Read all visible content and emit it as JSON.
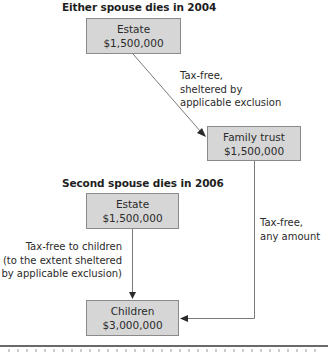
{
  "sections": [
    {
      "heading": "Either spouse dies in 2004",
      "estate": {
        "title": "Estate",
        "amount": "$1,500,000"
      },
      "transfer_label": [
        "Tax-free,",
        "sheltered by",
        "applicable exclusion"
      ],
      "trust": {
        "title": "Family trust",
        "amount": "$1,500,000"
      }
    },
    {
      "heading": "Second spouse dies in 2006",
      "estate": {
        "title": "Estate",
        "amount": "$1,500,000"
      },
      "transfer_label": [
        "Tax-free to children",
        "(to the extent sheltered",
        "by applicable exclusion)"
      ],
      "trust_to_children_label": [
        "Tax-free,",
        "any amount"
      ],
      "children": {
        "title": "Children",
        "amount": "$3,000,000"
      }
    }
  ],
  "colors": {
    "box_fill": "#d6d6d6",
    "box_border": "#8a8a8a",
    "line": "#7a7a7a",
    "arrowhead": "#2a2a2a"
  }
}
